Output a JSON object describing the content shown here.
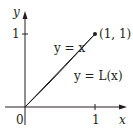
{
  "diagram": {
    "type": "lorenz-curve",
    "axes": {
      "x_label": "x",
      "y_label": "y",
      "origin_label": "0",
      "x_tick_label": "1",
      "y_tick_label": "1"
    },
    "curves": [
      {
        "name": "line",
        "label": "y = x"
      },
      {
        "name": "lorenz",
        "label": "y = L(x)"
      }
    ],
    "point": {
      "label": "(1, 1)"
    },
    "colors": {
      "axis": "#231f20",
      "curve": "#231f20",
      "fill": "#d9d9d9"
    }
  }
}
